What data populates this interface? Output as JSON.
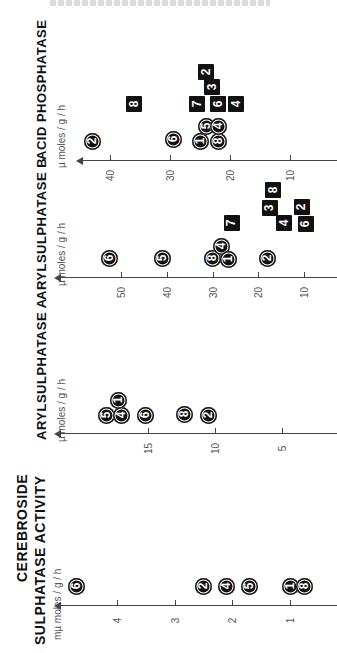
{
  "chart_data": [
    {
      "type": "scatter",
      "title": "ACID PHOSPHATASE",
      "ylabel": "µ moles / g / h",
      "ticks": [
        10,
        20,
        30,
        40
      ],
      "axis": {
        "y": 160,
        "x_start": 80,
        "x_end": 337,
        "ref": [
          [
            40,
            110
          ],
          [
            10,
            290
          ]
        ]
      },
      "series": [
        {
          "name": "circles",
          "marker": "circle",
          "points": [
            {
              "label": "2",
              "value": 43,
              "dy": 141
            },
            {
              "label": "6",
              "value": 29.5,
              "dy": 139
            },
            {
              "label": "1",
              "value": 25,
              "dy": 141
            },
            {
              "label": "5",
              "value": 24,
              "dy": 126
            },
            {
              "label": "8",
              "value": 22,
              "dy": 141
            },
            {
              "label": "4",
              "value": 22,
              "dy": 126
            }
          ]
        },
        {
          "name": "squares",
          "marker": "square",
          "points": [
            {
              "label": "8",
              "value": 36,
              "dy": 104
            },
            {
              "label": "7",
              "value": 25.5,
              "dy": 104
            },
            {
              "label": "2",
              "value": 24,
              "dy": 72
            },
            {
              "label": "3",
              "value": 23,
              "dy": 87
            },
            {
              "label": "6",
              "value": 22,
              "dy": 104
            },
            {
              "label": "4",
              "value": 19,
              "dy": 104
            }
          ]
        }
      ]
    },
    {
      "type": "scatter",
      "title": "ARYLSULPHATASE B",
      "ylabel": "µ moles / g / h",
      "ticks": [
        10,
        20,
        30,
        40,
        50
      ],
      "axis": {
        "y": 277,
        "x_start": 58,
        "x_end": 337,
        "ref": [
          [
            50,
            121
          ],
          [
            10,
            304
          ]
        ]
      },
      "series": [
        {
          "name": "circles",
          "marker": "circle",
          "points": [
            {
              "label": "6",
              "value": 52.5,
              "dy": 258
            },
            {
              "label": "5",
              "value": 41,
              "dy": 258
            },
            {
              "label": "8",
              "value": 30,
              "dy": 258
            },
            {
              "label": "4",
              "value": 28,
              "dy": 246
            },
            {
              "label": "1",
              "value": 26.5,
              "dy": 259
            },
            {
              "label": "2",
              "value": 18,
              "dy": 258
            }
          ]
        },
        {
          "name": "squares",
          "marker": "square",
          "points": [
            {
              "label": "7",
              "value": 25.8,
              "dy": 223
            },
            {
              "label": "8",
              "value": 16.8,
              "dy": 190
            },
            {
              "label": "3",
              "value": 17.5,
              "dy": 208
            },
            {
              "label": "4",
              "value": 14.4,
              "dy": 223
            },
            {
              "label": "2",
              "value": 10.5,
              "dy": 207
            },
            {
              "label": "6",
              "value": 9.6,
              "dy": 224
            }
          ]
        }
      ]
    },
    {
      "type": "scatter",
      "title": "ARYLSULPHATASE A",
      "ylabel": "µ moles / g / h",
      "ticks": [
        5,
        10,
        15
      ],
      "axis": {
        "y": 433,
        "x_start": 58,
        "x_end": 337,
        "ref": [
          [
            15,
            148
          ],
          [
            5,
            282
          ]
        ]
      },
      "series": [
        {
          "name": "circles",
          "marker": "circle",
          "points": [
            {
              "label": "5",
              "value": 18.1,
              "dy": 415
            },
            {
              "label": "1",
              "value": 17.2,
              "dy": 400
            },
            {
              "label": "4",
              "value": 17,
              "dy": 415
            },
            {
              "label": "6",
              "value": 15.2,
              "dy": 415
            },
            {
              "label": "8",
              "value": 12.3,
              "dy": 414
            },
            {
              "label": "2",
              "value": 10.5,
              "dy": 415
            }
          ]
        }
      ]
    },
    {
      "type": "scatter",
      "title": "CEREBROSIDE SULPHATASE ACTIVITY",
      "ylabel": "mµ moles / g / h",
      "ticks": [
        1,
        2,
        3,
        4
      ],
      "axis": {
        "y": 605,
        "x_start": 58,
        "x_end": 337,
        "ref": [
          [
            4,
            117
          ],
          [
            1,
            290
          ]
        ]
      },
      "series": [
        {
          "name": "circles",
          "marker": "circle",
          "points": [
            {
              "label": "6",
              "value": 4.7,
              "dy": 586
            },
            {
              "label": "2",
              "value": 2.5,
              "dy": 586
            },
            {
              "label": "4",
              "value": 2.1,
              "dy": 586
            },
            {
              "label": "5",
              "value": 1.7,
              "dy": 586
            },
            {
              "label": "1",
              "value": 1.0,
              "dy": 586
            },
            {
              "label": "8",
              "value": 0.75,
              "dy": 586
            }
          ]
        }
      ]
    }
  ],
  "labels": {
    "acid_phosphatase": "ACID  PHOSPHATASE",
    "aryl_b": "ARYLSULPHATASE B",
    "aryl_a": "ARYLSULPHATASE A",
    "cerebroside_line1": "CEREBROSIDE",
    "cerebroside_line2": "SULPHATASE  ACTIVITY",
    "unit_micro": "µ moles / g / h",
    "unit_milli_micro": "mµ moles / g / h"
  }
}
